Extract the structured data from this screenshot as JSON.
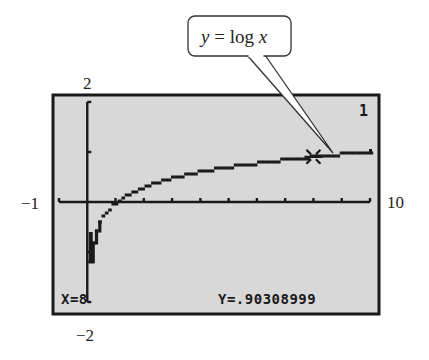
{
  "chart_data": {
    "type": "line",
    "title": "",
    "function_label": "y = log x",
    "series": [
      {
        "name": "y = log x",
        "x": [
          0.063,
          0.1,
          0.2,
          0.3,
          0.5,
          0.75,
          1,
          1.5,
          2,
          3,
          4,
          5,
          6,
          7,
          8,
          9,
          10
        ],
        "values": [
          -1.2,
          -1,
          -0.699,
          -0.523,
          -0.301,
          -0.125,
          0,
          0.176,
          0.301,
          0.477,
          0.602,
          0.699,
          0.778,
          0.845,
          0.903,
          0.954,
          1
        ]
      }
    ],
    "xlabel": "",
    "ylabel": "",
    "xlim": [
      -1,
      10
    ],
    "ylim": [
      -2,
      2
    ],
    "xscale": 1,
    "yscale": 1,
    "grid": false,
    "trace_point": {
      "x": 8,
      "y": 0.90308999
    }
  },
  "window": {
    "xmin_label": "−1",
    "xmax_label": "10",
    "ymax_label": "2",
    "ymin_label": "−2"
  },
  "screen": {
    "equation_number": "1",
    "x_readout": "X=8",
    "y_readout": "Y=.90308999",
    "background": "#d8d8d8",
    "ink": "#1a1a1a"
  },
  "callout": {
    "y_var": "y",
    "equals": " = log ",
    "x_var": "x"
  }
}
